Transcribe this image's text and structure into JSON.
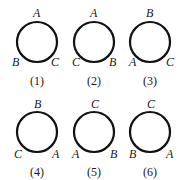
{
  "figures": [
    {
      "caption": "(1)",
      "top": "A",
      "bottom_left": "B",
      "bottom_right": "C",
      "cx": 37,
      "cy": 42
    },
    {
      "caption": "(2)",
      "top": "A",
      "bottom_left": "C",
      "bottom_right": "B",
      "cx": 94,
      "cy": 42
    },
    {
      "caption": "(3)",
      "top": "B",
      "bottom_left": "A",
      "bottom_right": "C",
      "cx": 150,
      "cy": 42
    },
    {
      "caption": "(4)",
      "top": "B",
      "bottom_left": "C",
      "bottom_right": "A",
      "cx": 37,
      "cy": 132
    },
    {
      "caption": "(5)",
      "top": "C",
      "bottom_left": "A",
      "bottom_right": "B",
      "cx": 94,
      "cy": 132
    },
    {
      "caption": "(6)",
      "top": "C",
      "bottom_left": "B",
      "bottom_right": "A",
      "cx": 150,
      "cy": 132
    }
  ],
  "style": {
    "stroke": "#111111",
    "radius": 20
  }
}
